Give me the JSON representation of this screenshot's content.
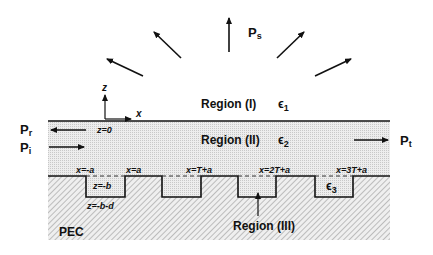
{
  "regions": {
    "region1": {
      "label": "Region (I)",
      "eps": "ϵ",
      "eps_sub": "1"
    },
    "region2": {
      "label": "Region (II)",
      "eps": "ϵ",
      "eps_sub": "2"
    },
    "region3": {
      "label": "Region (III)",
      "eps": "ϵ",
      "eps_sub": "3"
    },
    "pec": {
      "label": "PEC"
    }
  },
  "power": {
    "scattered": {
      "main": "P",
      "sub": "s"
    },
    "reflected": {
      "main": "P",
      "sub": "r"
    },
    "incident": {
      "main": "P",
      "sub": "i"
    },
    "transmitted": {
      "main": "P",
      "sub": "t"
    }
  },
  "axes": {
    "z": "z",
    "x": "x"
  },
  "coords": {
    "z0": "z=0",
    "zb": "z=-b",
    "zbd": "z=-b-d",
    "x_neg_a": "x=-a",
    "x_a": "x=a",
    "x_T": "x=T+a",
    "x_2T": "x=2T+a",
    "x_3T": "x=3T+a"
  }
}
